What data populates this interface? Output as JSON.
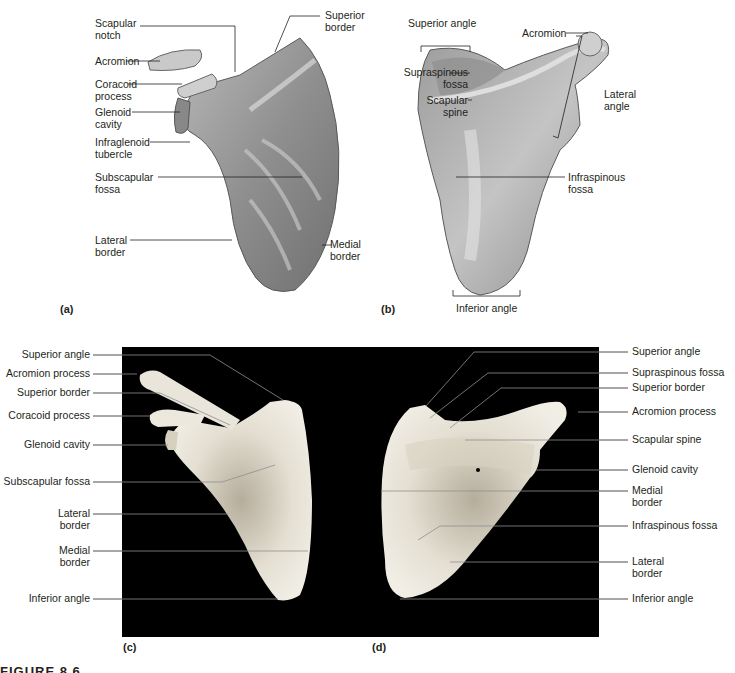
{
  "figure": {
    "caption": "FIGURE 8.6",
    "panels": {
      "a": {
        "tag": "(a)",
        "view": "anterior illustration",
        "labels": {
          "scapular_notch": "Scapular\nnotch",
          "acromion": "Acromion",
          "coracoid_process": "Coracoid\nprocess",
          "glenoid_cavity": "Glenoid\ncavity",
          "infraglenoid_tubercle": "Infraglenoid\ntubercle",
          "subscapular_fossa": "Subscapular\nfossa",
          "lateral_border": "Lateral\nborder",
          "superior_border": "Superior\nborder",
          "medial_border": "Medial\nborder"
        }
      },
      "b": {
        "tag": "(b)",
        "view": "posterior illustration",
        "labels": {
          "superior_angle": "Superior angle",
          "acromion": "Acromion",
          "supraspinous_fossa": "Supraspinous\nfossa",
          "scapular_spine": "Scapular\nspine",
          "lateral_angle": "Lateral\nangle",
          "infraspinous_fossa": "Infraspinous\nfossa",
          "inferior_angle": "Inferior angle"
        }
      },
      "c": {
        "tag": "(c)",
        "view": "anterior photograph",
        "labels": {
          "superior_angle": "Superior angle",
          "acromion_process": "Acromion process",
          "superior_border": "Superior border",
          "coracoid_process": "Coracoid process",
          "glenoid_cavity": "Glenoid cavity",
          "subscapular_fossa": "Subscapular fossa",
          "lateral_border": "Lateral\nborder",
          "medial_border": "Medial\nborder",
          "inferior_angle": "Inferior angle"
        }
      },
      "d": {
        "tag": "(d)",
        "view": "posterior photograph",
        "labels": {
          "superior_angle": "Superior angle",
          "supraspinous_fossa": "Supraspinous fossa",
          "superior_border": "Superior border",
          "acromion_process": "Acromion process",
          "scapular_spine": "Scapular spine",
          "glenoid_cavity": "Glenoid cavity",
          "medial_border": "Medial\nborder",
          "infraspinous_fossa": "Infraspinous fossa",
          "lateral_border": "Lateral\nborder",
          "inferior_angle": "Inferior angle"
        }
      }
    },
    "colors": {
      "bone_illustration": "#9a9a9a",
      "bone_highlight": "#d8d8d8",
      "bone_photo": "#e6e2d6",
      "photo_background": "#000000",
      "leader_line": "#231f20",
      "leader_line_on_photo": "#9a9a9a"
    }
  }
}
